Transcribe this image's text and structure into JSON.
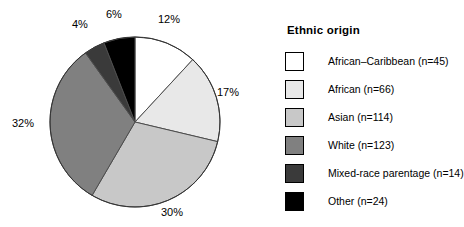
{
  "chart_data": {
    "type": "pie",
    "title": "",
    "legend_title": "Ethnic origin",
    "legend_position": "right",
    "grid": false,
    "total_n": 386,
    "start_angle_deg": 0,
    "direction": "clockwise",
    "categories": [
      "African–Caribbean",
      "African",
      "Asian",
      "White",
      "Mixed-race parentage",
      "Other"
    ],
    "values": [
      12,
      17,
      30,
      32,
      4,
      6
    ],
    "counts": [
      45,
      66,
      114,
      123,
      14,
      24
    ],
    "value_labels": [
      "12%",
      "17%",
      "30%",
      "32%",
      "4%",
      "6%"
    ],
    "colors": [
      "#ffffff",
      "#e8e8e8",
      "#c8c8c8",
      "#808080",
      "#3a3a3a",
      "#000000"
    ],
    "slice_outline_color": "#4d4d4d"
  },
  "pie": {
    "labels": [
      {
        "id": "lbl-12",
        "text": "12%"
      },
      {
        "id": "lbl-17",
        "text": "17%"
      },
      {
        "id": "lbl-30",
        "text": "30%"
      },
      {
        "id": "lbl-32",
        "text": "32%"
      },
      {
        "id": "lbl-4",
        "text": "4%"
      },
      {
        "id": "lbl-6",
        "text": "6%"
      }
    ]
  },
  "legend": {
    "title": "Ethnic origin",
    "items": [
      {
        "label": "African–Caribbean (n=45)",
        "color": "#ffffff"
      },
      {
        "label": "African (n=66)",
        "color": "#e8e8e8"
      },
      {
        "label": "Asian (n=114)",
        "color": "#c8c8c8"
      },
      {
        "label": "White (n=123)",
        "color": "#808080"
      },
      {
        "label": "Mixed-race parentage (n=14)",
        "color": "#3a3a3a"
      },
      {
        "label": "Other (n=24)",
        "color": "#000000"
      }
    ]
  }
}
